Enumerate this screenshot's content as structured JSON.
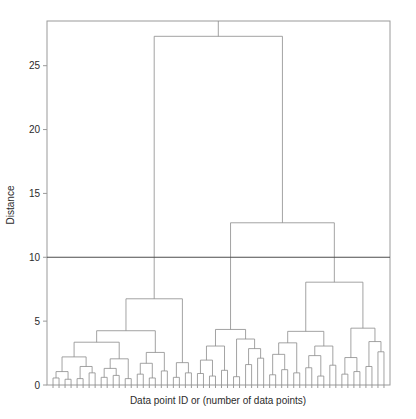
{
  "chart_data": {
    "type": "dendrogram",
    "title": "",
    "subtitle": "",
    "xlabel": "Data point ID or (number of data points)",
    "ylabel": "Distance",
    "ylim": [
      0,
      28.5
    ],
    "xlim": [
      0,
      56
    ],
    "yticks": [
      0,
      5,
      10,
      15,
      20,
      25
    ],
    "ytick_labels": [
      "0",
      "5",
      "10",
      "15",
      "20",
      "25"
    ],
    "xticks": [],
    "xtick_labels": [],
    "grid": false,
    "legend": null,
    "line_color": "#8c8c8c",
    "threshold_color": "#4d4d4d",
    "axis_color": "#9a9a9a",
    "background": "#ffffff",
    "annotations": [
      {
        "name": "distance-threshold-line",
        "kind": "horizontal-line",
        "y": 10,
        "label": ""
      }
    ],
    "n_leaves": 56,
    "leaf_order": [
      0,
      1,
      2,
      3,
      4,
      5,
      6,
      7,
      8,
      9,
      10,
      11,
      12,
      13,
      14,
      15,
      16,
      17,
      18,
      19,
      20,
      21,
      22,
      23,
      24,
      25,
      26,
      27,
      28,
      29,
      30,
      31,
      32,
      33,
      34,
      35,
      36,
      37,
      38,
      39,
      40,
      41,
      42,
      43,
      44,
      45,
      46,
      47,
      48,
      49,
      50,
      51,
      52,
      53,
      54,
      55
    ],
    "merges": [
      {
        "id": 56,
        "left": 0,
        "right": 1,
        "height": 0.55
      },
      {
        "id": 57,
        "left": 2,
        "right": 3,
        "height": 0.45
      },
      {
        "id": 58,
        "left": 56,
        "right": 57,
        "height": 1.05
      },
      {
        "id": 59,
        "left": 4,
        "right": 5,
        "height": 0.5
      },
      {
        "id": 60,
        "left": 6,
        "right": 7,
        "height": 0.95
      },
      {
        "id": 61,
        "left": 59,
        "right": 60,
        "height": 1.45
      },
      {
        "id": 62,
        "left": 58,
        "right": 61,
        "height": 2.2
      },
      {
        "id": 63,
        "left": 8,
        "right": 9,
        "height": 0.6
      },
      {
        "id": 64,
        "left": 10,
        "right": 11,
        "height": 0.75
      },
      {
        "id": 65,
        "left": 63,
        "right": 64,
        "height": 1.3
      },
      {
        "id": 66,
        "left": 12,
        "right": 13,
        "height": 0.5
      },
      {
        "id": 67,
        "left": 65,
        "right": 66,
        "height": 2.05
      },
      {
        "id": 68,
        "left": 62,
        "right": 67,
        "height": 3.35
      },
      {
        "id": 69,
        "left": 14,
        "right": 15,
        "height": 0.85
      },
      {
        "id": 70,
        "left": 16,
        "right": 17,
        "height": 0.55
      },
      {
        "id": 71,
        "left": 69,
        "right": 70,
        "height": 1.7
      },
      {
        "id": 72,
        "left": 18,
        "right": 19,
        "height": 1.1
      },
      {
        "id": 73,
        "left": 71,
        "right": 72,
        "height": 2.55
      },
      {
        "id": 74,
        "left": 68,
        "right": 73,
        "height": 4.25
      },
      {
        "id": 75,
        "left": 20,
        "right": 21,
        "height": 0.6
      },
      {
        "id": 76,
        "left": 22,
        "right": 23,
        "height": 0.95
      },
      {
        "id": 77,
        "left": 75,
        "right": 76,
        "height": 1.75
      },
      {
        "id": 78,
        "left": 74,
        "right": 77,
        "height": 6.75
      },
      {
        "id": 79,
        "left": 24,
        "right": 25,
        "height": 0.9
      },
      {
        "id": 80,
        "left": 26,
        "right": 27,
        "height": 0.7
      },
      {
        "id": 81,
        "left": 79,
        "right": 80,
        "height": 1.95
      },
      {
        "id": 82,
        "left": 28,
        "right": 29,
        "height": 1.15
      },
      {
        "id": 83,
        "left": 81,
        "right": 82,
        "height": 3.05
      },
      {
        "id": 84,
        "left": 30,
        "right": 31,
        "height": 0.65
      },
      {
        "id": 85,
        "left": 32,
        "right": 33,
        "height": 1.6
      },
      {
        "id": 86,
        "left": 34,
        "right": 35,
        "height": 2.1
      },
      {
        "id": 87,
        "left": 85,
        "right": 86,
        "height": 2.85
      },
      {
        "id": 88,
        "left": 84,
        "right": 87,
        "height": 3.6
      },
      {
        "id": 89,
        "left": 83,
        "right": 88,
        "height": 4.35
      },
      {
        "id": 90,
        "left": 36,
        "right": 37,
        "height": 0.8
      },
      {
        "id": 91,
        "left": 38,
        "right": 39,
        "height": 1.2
      },
      {
        "id": 92,
        "left": 90,
        "right": 91,
        "height": 2.4
      },
      {
        "id": 93,
        "left": 40,
        "right": 41,
        "height": 0.95
      },
      {
        "id": 94,
        "left": 92,
        "right": 93,
        "height": 3.3
      },
      {
        "id": 95,
        "left": 42,
        "right": 43,
        "height": 1.35
      },
      {
        "id": 96,
        "left": 44,
        "right": 45,
        "height": 0.7
      },
      {
        "id": 97,
        "left": 95,
        "right": 96,
        "height": 2.3
      },
      {
        "id": 98,
        "left": 46,
        "right": 47,
        "height": 1.55
      },
      {
        "id": 99,
        "left": 97,
        "right": 98,
        "height": 3.05
      },
      {
        "id": 100,
        "left": 94,
        "right": 99,
        "height": 4.2
      },
      {
        "id": 101,
        "left": 48,
        "right": 49,
        "height": 0.85
      },
      {
        "id": 102,
        "left": 50,
        "right": 51,
        "height": 1.05
      },
      {
        "id": 103,
        "left": 101,
        "right": 102,
        "height": 2.15
      },
      {
        "id": 104,
        "left": 52,
        "right": 53,
        "height": 1.45
      },
      {
        "id": 105,
        "left": 54,
        "right": 55,
        "height": 2.6
      },
      {
        "id": 106,
        "left": 104,
        "right": 105,
        "height": 3.4
      },
      {
        "id": 107,
        "left": 103,
        "right": 106,
        "height": 4.45
      },
      {
        "id": 108,
        "left": 100,
        "right": 107,
        "height": 8.05
      },
      {
        "id": 109,
        "left": 89,
        "right": 108,
        "height": 12.7
      },
      {
        "id": 110,
        "left": 78,
        "right": 109,
        "height": 27.3
      }
    ]
  },
  "axes": {
    "left_px": 47,
    "right_px": 390,
    "top_px": 21,
    "bottom_px": 385
  }
}
